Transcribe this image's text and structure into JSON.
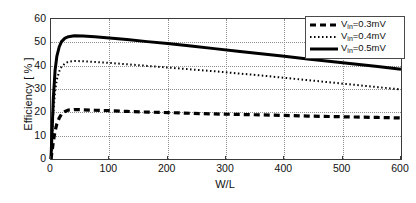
{
  "chart_data": {
    "type": "line",
    "title": "",
    "xlabel": "W/L",
    "ylabel": "Efficiency [ % ]",
    "xlim": [
      0,
      600
    ],
    "ylim": [
      0,
      60
    ],
    "xticks": [
      0,
      100,
      200,
      300,
      400,
      500,
      600
    ],
    "yticks": [
      0,
      10,
      20,
      30,
      40,
      50,
      60
    ],
    "grid": true,
    "legend_position": "top-right",
    "series": [
      {
        "name": "Vin=0.3mV",
        "label_main": "V",
        "label_sub": "in",
        "label_rest": "=0.3mV",
        "style": "dashed",
        "color": "#000000",
        "width": 3.2,
        "dash": "6,4",
        "x": [
          0,
          2,
          4,
          7,
          10,
          14,
          18,
          24,
          30,
          40,
          55,
          75,
          100,
          130,
          165,
          200,
          240,
          280,
          320,
          360,
          400,
          440,
          480,
          520,
          560,
          600
        ],
        "y": [
          0,
          3.5,
          7.5,
          12.0,
          15.0,
          17.5,
          19.2,
          20.4,
          21.0,
          21.2,
          21.1,
          20.9,
          20.7,
          20.4,
          20.1,
          19.9,
          19.6,
          19.3,
          19.1,
          18.9,
          18.7,
          18.4,
          18.2,
          18.0,
          17.8,
          17.6
        ]
      },
      {
        "name": "Vin=0.4mV",
        "label_main": "V",
        "label_sub": "in",
        "label_rest": "=0.4mV",
        "style": "dotted",
        "color": "#000000",
        "width": 2.0,
        "dash": "1.5,2.5",
        "x": [
          0,
          2,
          4,
          7,
          10,
          14,
          18,
          24,
          30,
          40,
          55,
          75,
          100,
          130,
          165,
          200,
          240,
          280,
          320,
          360,
          400,
          440,
          480,
          520,
          560,
          600
        ],
        "y": [
          0,
          10.0,
          20.0,
          29.0,
          34.0,
          37.5,
          39.5,
          41.0,
          41.7,
          42.0,
          41.9,
          41.6,
          41.2,
          40.6,
          39.9,
          39.2,
          38.4,
          37.6,
          36.7,
          35.8,
          34.8,
          33.8,
          32.8,
          31.8,
          30.8,
          29.8
        ]
      },
      {
        "name": "Vin=0.5mV",
        "label_main": "V",
        "label_sub": "in",
        "label_rest": "=0.5mV",
        "style": "solid",
        "color": "#000000",
        "width": 3.0,
        "dash": "",
        "x": [
          0,
          2,
          4,
          7,
          10,
          14,
          18,
          24,
          30,
          40,
          55,
          75,
          100,
          130,
          165,
          200,
          240,
          280,
          320,
          360,
          400,
          440,
          480,
          520,
          560,
          600
        ],
        "y": [
          0,
          13.0,
          26.0,
          38.0,
          44.0,
          48.0,
          50.3,
          51.8,
          52.4,
          52.8,
          52.7,
          52.4,
          51.9,
          51.2,
          50.3,
          49.5,
          48.4,
          47.3,
          46.2,
          45.1,
          44.0,
          42.9,
          41.8,
          40.7,
          39.6,
          38.5
        ]
      }
    ]
  }
}
